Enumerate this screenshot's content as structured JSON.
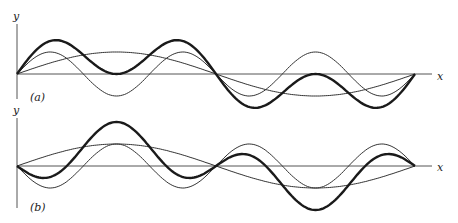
{
  "figure": {
    "panels": [
      {
        "id": "a",
        "label": "(a)",
        "y_axis_label": "y",
        "x_axis_label": "x",
        "origin": [
          17,
          74
        ],
        "x_end": 432,
        "y_top": 24,
        "y_bottom": 99,
        "length_px": 398,
        "amplitude_px": 22,
        "label_pos": [
          30,
          101
        ],
        "y_label_pos": [
          13,
          20
        ],
        "x_label_pos": [
          437,
          80
        ],
        "curves": [
          {
            "name": "fundamental",
            "style": "thin",
            "terms": [
              [
                1,
                1
              ]
            ]
          },
          {
            "name": "third-harmonic",
            "style": "thin",
            "terms": [
              [
                3,
                1
              ]
            ]
          },
          {
            "name": "sum",
            "style": "thick",
            "terms": [
              [
                1,
                1
              ],
              [
                3,
                1
              ]
            ]
          }
        ]
      },
      {
        "id": "b",
        "label": "(b)",
        "y_axis_label": "y",
        "x_axis_label": "x",
        "origin": [
          17,
          166
        ],
        "x_end": 432,
        "y_top": 118,
        "y_bottom": 208,
        "length_px": 398,
        "amplitude_px": 22,
        "label_pos": [
          30,
          211
        ],
        "y_label_pos": [
          13,
          114
        ],
        "x_label_pos": [
          437,
          171
        ],
        "curves": [
          {
            "name": "fundamental",
            "style": "thin",
            "terms": [
              [
                1,
                1
              ]
            ]
          },
          {
            "name": "third-harmonic",
            "style": "thin",
            "terms": [
              [
                3,
                -1
              ]
            ]
          },
          {
            "name": "sum",
            "style": "thick",
            "terms": [
              [
                1,
                1
              ],
              [
                3,
                -1
              ]
            ]
          }
        ]
      }
    ]
  }
}
